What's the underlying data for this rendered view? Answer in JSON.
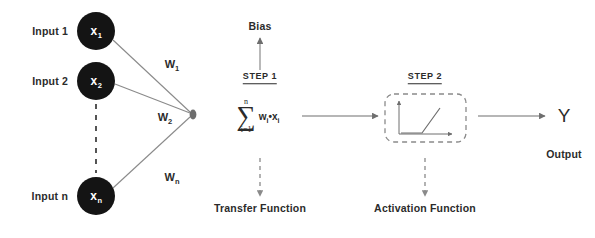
{
  "diagram": {
    "colors": {
      "node_fill": "#141414",
      "node_text": "#ffffff",
      "line": "#6e6e6e",
      "text": "#2b2b2b",
      "dashed": "#8a8a8a",
      "background": "#ffffff"
    },
    "inputs": [
      {
        "label": "Input 1",
        "node": "x",
        "node_sub": "1"
      },
      {
        "label": "Input 2",
        "node": "x",
        "node_sub": "2"
      },
      {
        "label": "Input n",
        "node": "x",
        "node_sub": "n"
      }
    ],
    "weights": [
      {
        "symbol": "W",
        "sub": "1"
      },
      {
        "symbol": "W",
        "sub": "2"
      },
      {
        "symbol": "W",
        "sub": "n"
      }
    ],
    "bias": {
      "label": "Bias"
    },
    "step1": {
      "label": "STEP 1",
      "formula": {
        "upper_limit": "n",
        "sigma": "∑",
        "lower_limit": "i=1",
        "term": "w",
        "term_sub1": "i",
        "operator": "•",
        "term2": "x",
        "term_sub2": "i"
      },
      "caption": "Transfer Function"
    },
    "step2": {
      "label": "STEP 2",
      "caption": "Activation Function",
      "plot": {
        "type": "relu",
        "description": "piecewise-linear activation curve"
      }
    },
    "output": {
      "symbol": "Y",
      "caption": "Output"
    },
    "vertical_ellipsis": "dashed"
  }
}
